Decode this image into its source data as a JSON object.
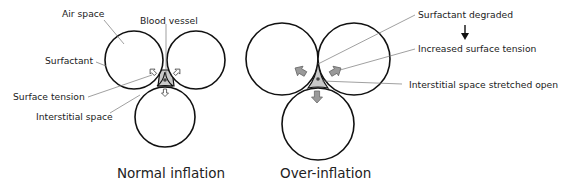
{
  "figure": {
    "panels": [
      {
        "id": "normal",
        "caption": "Normal inflation",
        "labels": {
          "air_space": "Air space",
          "blood_vessel": "Blood vessel",
          "surfactant": "Surfactant",
          "surface_tension": "Surface tension",
          "interstitial_space": "Interstitial space"
        }
      },
      {
        "id": "over",
        "caption": "Over-inflation",
        "labels": {
          "surfactant_degraded": "Surfactant degraded",
          "increased_surface_tension": "Increased surface tension",
          "interstitial_stretched": "Interstitial space stretched open"
        },
        "flow_arrow": "down-arrow"
      }
    ],
    "colors": {
      "outline": "#111111",
      "interstitial_fill": "#c9c9c9",
      "force_arrow_fill_over": "#9a9a9a",
      "leader_line": "#777777"
    }
  }
}
